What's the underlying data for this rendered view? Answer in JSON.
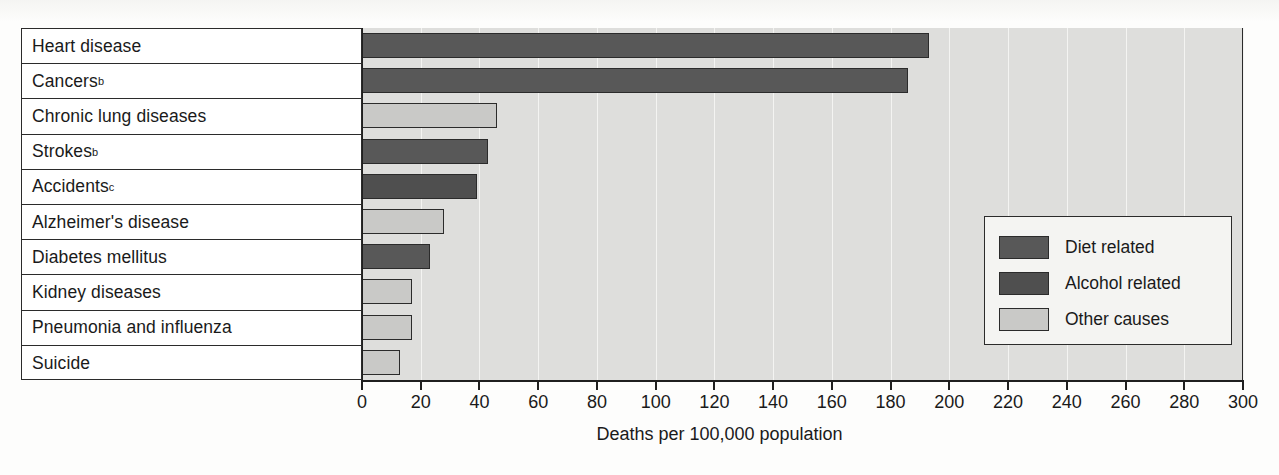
{
  "chart_data": {
    "type": "bar",
    "orientation": "horizontal",
    "title": "",
    "xlabel": "Deaths per 100,000 population",
    "ylabel": "",
    "xlim": [
      0,
      300
    ],
    "xticks": [
      0,
      20,
      40,
      60,
      80,
      100,
      120,
      140,
      160,
      180,
      200,
      220,
      240,
      260,
      280,
      300
    ],
    "grid": true,
    "grid_axis": "x",
    "legend_position": "inside-right",
    "categories": [
      "Heart disease",
      "Cancers",
      "Chronic lung diseases",
      "Strokes",
      "Accidents",
      "Alzheimer's disease",
      "Diabetes mellitus",
      "Kidney diseases",
      "Pneumonia and influenza",
      "Suicide"
    ],
    "category_footnotes": [
      "",
      "b",
      "",
      "b",
      "c",
      "",
      "",
      "",
      "",
      ""
    ],
    "values": [
      193,
      186,
      46,
      43,
      39,
      28,
      23,
      17,
      17,
      13
    ],
    "categories_series": [
      "diet",
      "diet",
      "other",
      "diet",
      "alcohol",
      "other",
      "diet",
      "other",
      "other",
      "other"
    ],
    "series": [
      {
        "name": "Diet related",
        "key": "diet",
        "color": "#585858"
      },
      {
        "name": "Alcohol related",
        "key": "alcohol",
        "color": "#4f4f4f"
      },
      {
        "name": "Other causes",
        "key": "other",
        "color": "#c9c9c7"
      }
    ]
  },
  "axis": {
    "x_title": "Deaths per 100,000 population",
    "tick_labels": [
      "0",
      "20",
      "40",
      "60",
      "80",
      "100",
      "120",
      "140",
      "160",
      "180",
      "200",
      "220",
      "240",
      "260",
      "280",
      "300"
    ]
  },
  "rows": [
    {
      "label": "Heart disease",
      "footnote": "",
      "value": 193,
      "series": "diet"
    },
    {
      "label": "Cancers",
      "footnote": "b",
      "value": 186,
      "series": "diet"
    },
    {
      "label": "Chronic lung diseases",
      "footnote": "",
      "value": 46,
      "series": "other"
    },
    {
      "label": "Strokes",
      "footnote": "b",
      "value": 43,
      "series": "diet"
    },
    {
      "label": "Accidents",
      "footnote": "c",
      "value": 39,
      "series": "alcohol"
    },
    {
      "label": "Alzheimer's disease",
      "footnote": "",
      "value": 28,
      "series": "other"
    },
    {
      "label": "Diabetes mellitus",
      "footnote": "",
      "value": 23,
      "series": "diet"
    },
    {
      "label": "Kidney diseases",
      "footnote": "",
      "value": 17,
      "series": "other"
    },
    {
      "label": "Pneumonia and influenza",
      "footnote": "",
      "value": 17,
      "series": "other"
    },
    {
      "label": "Suicide",
      "footnote": "",
      "value": 13,
      "series": "other"
    }
  ],
  "legend": {
    "items": [
      {
        "label": "Diet related",
        "key": "diet"
      },
      {
        "label": "Alcohol related",
        "key": "alcohol"
      },
      {
        "label": "Other causes",
        "key": "other"
      }
    ]
  },
  "colors": {
    "diet": "#585858",
    "alcohol": "#4f4f4f",
    "other": "#c9c9c7",
    "plot_background": "#dededc",
    "axis": "#1f1f1f",
    "gridline": "#f4f4f2"
  }
}
